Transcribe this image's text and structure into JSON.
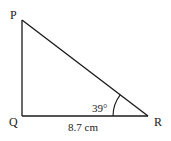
{
  "diagram": {
    "type": "right-triangle",
    "vertices": {
      "P": {
        "label": "P"
      },
      "Q": {
        "label": "Q"
      },
      "R": {
        "label": "R"
      }
    },
    "right_angle_at": "Q",
    "angle": {
      "vertex": "R",
      "label": "39°",
      "value_deg": 39
    },
    "side_QR": {
      "label": "8.7 cm",
      "length": 8.7,
      "unit": "cm"
    },
    "colors": {
      "stroke": "#1a1a1a",
      "background": "#ffffff"
    }
  }
}
